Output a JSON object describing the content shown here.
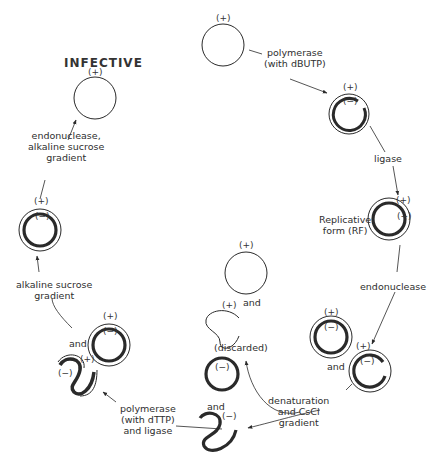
{
  "title": "INFECTIVE",
  "signs": {
    "plus": "(+)",
    "minus": "(−)"
  },
  "steps": {
    "polymerase_dbutp": "polymerase\n(with dBUTP)",
    "ligase": "ligase",
    "replicative_form": "Replicative\nform (RF)",
    "endonuclease": "endonuclease",
    "denaturation": "denaturation\nand CsCl\ngradient",
    "discarded": "(discarded)",
    "polymerase_dttp": "polymerase\n(with dTTP)\nand ligase",
    "alkaline_sucrose": "alkaline sucrose\ngradient",
    "endonuclease_alkaline": "endonuclease,\nalkaline sucrose\ngradient"
  },
  "and": "and",
  "colors": {
    "line": "#2a2a2a",
    "thick": "#2d2d2d",
    "background": "#ffffff"
  }
}
